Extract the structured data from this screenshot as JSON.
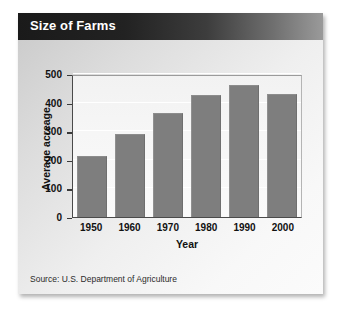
{
  "card": {
    "title": "Size of Farms",
    "source": "Source: U.S. Department of Agriculture"
  },
  "colors": {
    "bar_fill": "#7e7e7e",
    "title_bar_dark": "#1a1a1a",
    "title_text": "#ffffff",
    "axis_line": "#3a3a3a",
    "plot_background": "#f7f7f7",
    "gridline": "#ffffff",
    "card_background": "#e8e8e8"
  },
  "chart_data": {
    "type": "bar",
    "title": "Size of Farms",
    "categories": [
      "1950",
      "1960",
      "1970",
      "1980",
      "1990",
      "2000"
    ],
    "values": [
      215,
      290,
      365,
      425,
      460,
      430
    ],
    "xlabel": "Year",
    "ylabel": "Average acreage",
    "ylim": [
      0,
      500
    ],
    "yticks": [
      0,
      100,
      200,
      300,
      400,
      500
    ],
    "ytick_labels": [
      "0",
      "100",
      "200",
      "300",
      "400",
      "500"
    ],
    "grid": true,
    "legend": "none",
    "source": "Source: U.S. Department of Agriculture"
  }
}
